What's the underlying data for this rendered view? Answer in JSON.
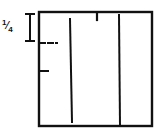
{
  "diagram": {
    "scale_label": "1/4",
    "scale_num": "1",
    "scale_den": "4",
    "stroke_color": "#111111",
    "elements": [
      {
        "name": "outer-square",
        "type": "rect"
      },
      {
        "name": "scale-bar",
        "type": "i-bar",
        "represents": "1/4"
      },
      {
        "name": "dashed-tick",
        "type": "dashed-mark"
      },
      {
        "name": "short-tick",
        "type": "tick"
      },
      {
        "name": "vertical-line-left",
        "type": "line"
      },
      {
        "name": "vertical-line-right",
        "type": "line"
      },
      {
        "name": "top-tick",
        "type": "tick"
      }
    ]
  }
}
